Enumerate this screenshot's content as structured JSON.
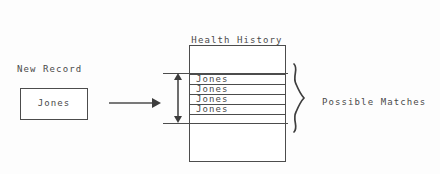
{
  "diagram": {
    "title_lines": [
      "Health History",
      "File"
    ],
    "new_record": {
      "label": "New Record",
      "value": "Jones"
    },
    "flow_arrow": {
      "icon": "arrow-right-icon"
    },
    "file": {
      "records": [
        {
          "value": "Jones"
        },
        {
          "value": "Jones"
        },
        {
          "value": "Jones"
        },
        {
          "value": "Jones"
        }
      ]
    },
    "span_marker": {
      "icon": "double-headed-vertical-arrow-icon"
    },
    "brace": {
      "icon": "curly-brace-icon",
      "label": "Possible Matches"
    },
    "colors": {
      "ink": "#4c4c4c",
      "text": "#4a4a4a",
      "background": "#fdfdfd"
    }
  }
}
